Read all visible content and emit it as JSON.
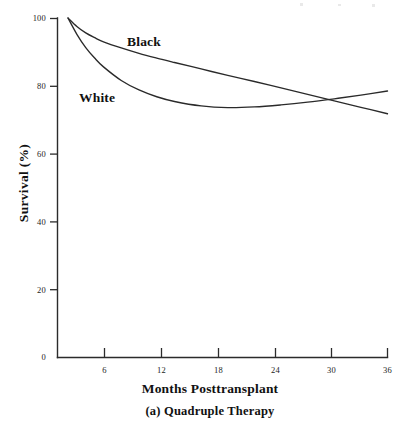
{
  "chart_data": {
    "type": "line",
    "title": "",
    "caption": "(a) Quadruple Therapy",
    "xlabel": "Months Posttransplant",
    "ylabel": "Survival (%)",
    "xlim": [
      0,
      36
    ],
    "ylim": [
      0,
      100
    ],
    "xticks": [
      6,
      12,
      18,
      24,
      30,
      36
    ],
    "xtick_labels": [
      "6",
      "12",
      "18",
      "24",
      "30",
      "36"
    ],
    "yticks": [
      0,
      20,
      40,
      60,
      80,
      100
    ],
    "ytick_labels": [
      "0",
      "20",
      "40",
      "60",
      "80",
      "100"
    ],
    "grid": false,
    "legend_position": "inline-annotation",
    "line_color": "#2a2a2a",
    "background_color": "#ffffff",
    "series": [
      {
        "name": "Black",
        "label_position": {
          "x": 8,
          "y": 92
        },
        "x": [
          0,
          1,
          2,
          3,
          4,
          6,
          8,
          10,
          12,
          15,
          18,
          21,
          24,
          27,
          30,
          33,
          36
        ],
        "values": [
          100,
          97.5,
          95.6,
          94.2,
          93.0,
          91.2,
          89.6,
          88.2,
          86.9,
          85.0,
          83.1,
          81.3,
          79.4,
          77.5,
          75.6,
          73.7,
          71.8
        ]
      },
      {
        "name": "White",
        "label_position": {
          "x": 3,
          "y": 79
        },
        "x": [
          0,
          1,
          2,
          3,
          4,
          6,
          8,
          10,
          12,
          15,
          18,
          21,
          24,
          27,
          30,
          33,
          36
        ],
        "values": [
          100,
          95.2,
          91.3,
          88.2,
          85.6,
          81.6,
          78.8,
          76.8,
          75.4,
          74.1,
          73.6,
          73.8,
          74.4,
          75.2,
          76.2,
          77.3,
          78.5
        ]
      }
    ],
    "annotations": [
      {
        "text": "Black",
        "kind": "series-label"
      },
      {
        "text": "White",
        "kind": "series-label"
      }
    ]
  }
}
